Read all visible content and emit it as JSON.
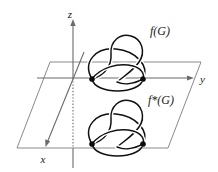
{
  "figure": {
    "background_color": "#ffffff",
    "width": 218,
    "height": 172
  },
  "axes": {
    "z": {
      "label": "z",
      "x": 73,
      "label_x": 73,
      "label_y": 16
    },
    "y": {
      "label": "y",
      "label_x": 200,
      "label_y": 82
    },
    "x": {
      "label": "x",
      "label_x": 46,
      "label_y": 160
    },
    "origin": {
      "x": 73,
      "y": 78
    },
    "axis_color": "#6b6b6b"
  },
  "plane": {
    "name": "xy-plane",
    "color": "#8a8a8a",
    "corners": [
      {
        "x": 50,
        "y": 62
      },
      {
        "x": 201,
        "y": 62
      },
      {
        "x": 168,
        "y": 148
      },
      {
        "x": 17,
        "y": 148
      }
    ]
  },
  "embeddings": [
    {
      "id": "upper",
      "label": "f(G)",
      "label_x": 150,
      "label_y": 32,
      "position": "above-plane",
      "vertices": [
        {
          "x": 92,
          "y": 79
        },
        {
          "x": 143,
          "y": 79
        }
      ],
      "edge_count": 3,
      "vertex_color": "#0d0d0d",
      "edge_color": "#111111"
    },
    {
      "id": "lower",
      "label": "f*(G)",
      "label_x": 150,
      "label_y": 101,
      "position": "below-plane",
      "vertices": [
        {
          "x": 92,
          "y": 144
        },
        {
          "x": 143,
          "y": 144
        }
      ],
      "edge_count": 3,
      "vertex_color": "#0d0d0d",
      "edge_color": "#111111"
    }
  ]
}
